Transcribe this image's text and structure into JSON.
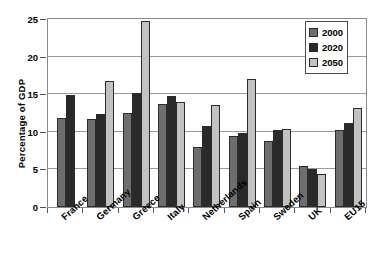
{
  "chart_data": {
    "type": "bar",
    "title": "",
    "xlabel": "",
    "ylabel": "Percentage of GDP",
    "ylim": [
      0,
      25
    ],
    "yticks": [
      0,
      5,
      10,
      15,
      20,
      25
    ],
    "grid": true,
    "legend_position": "top-right",
    "categories": [
      "France",
      "Germany",
      "Greece",
      "Italy",
      "Netherlands",
      "Spain",
      "Sweden",
      "UK",
      "EU15"
    ],
    "series": [
      {
        "name": "2000",
        "color": "#6e6e6e",
        "values": [
          11.8,
          11.7,
          12.5,
          13.7,
          8.0,
          9.4,
          8.8,
          5.5,
          10.2
        ]
      },
      {
        "name": "2020",
        "color": "#2a2a2a",
        "values": [
          14.9,
          12.4,
          15.2,
          14.8,
          10.8,
          9.8,
          10.3,
          5.0,
          11.2
        ]
      },
      {
        "name": "2050",
        "color": "#c2c2c2",
        "values": [
          null,
          16.8,
          24.8,
          14.0,
          13.5,
          17.0,
          10.4,
          4.4,
          13.2
        ]
      }
    ]
  },
  "legend": {
    "items": [
      {
        "label": "2000"
      },
      {
        "label": "2020"
      },
      {
        "label": "2050"
      }
    ]
  },
  "axes": {
    "y_title": "Percentage of GDP",
    "y_tick_labels": [
      "0",
      "5",
      "10",
      "15",
      "20",
      "25"
    ],
    "x_tick_labels": [
      "France",
      "Germany",
      "Greece",
      "Italy",
      "Netherlands",
      "Spain",
      "Sweden",
      "UK",
      "EU15"
    ]
  },
  "colors": {
    "series_2000": "#6e6e6e",
    "series_2020": "#2a2a2a",
    "series_2050": "#c2c2c2",
    "axis": "#555555",
    "grid": "#9a9a9a",
    "background": "#ffffff"
  }
}
